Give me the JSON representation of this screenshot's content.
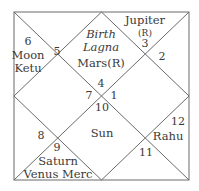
{
  "chart": {
    "style": "North Indian birth chart",
    "line_color": "#666666",
    "center_title": [
      "Birth",
      "Lagna"
    ],
    "houses": [
      {
        "house": 1,
        "sign": "4",
        "planets": [
          "Mars(R)"
        ]
      },
      {
        "house": 2,
        "sign": "3",
        "planets": [
          "Jupiter",
          "(R)"
        ]
      },
      {
        "house": 3,
        "sign": "2",
        "planets": []
      },
      {
        "house": 4,
        "sign": "1",
        "planets": []
      },
      {
        "house": 5,
        "sign": "12",
        "planets": [
          "Rahu"
        ]
      },
      {
        "house": 6,
        "sign": "11",
        "planets": []
      },
      {
        "house": 7,
        "sign": "10",
        "planets": [
          "Sun"
        ]
      },
      {
        "house": 8,
        "sign": "9",
        "planets": [
          "Saturn",
          "Venus Merc"
        ]
      },
      {
        "house": 9,
        "sign": "8",
        "planets": []
      },
      {
        "house": 10,
        "sign": "7",
        "planets": []
      },
      {
        "house": 11,
        "sign": "6",
        "planets": [
          "Moon",
          "Ketu"
        ]
      },
      {
        "house": 12,
        "sign": "5",
        "planets": []
      }
    ]
  }
}
